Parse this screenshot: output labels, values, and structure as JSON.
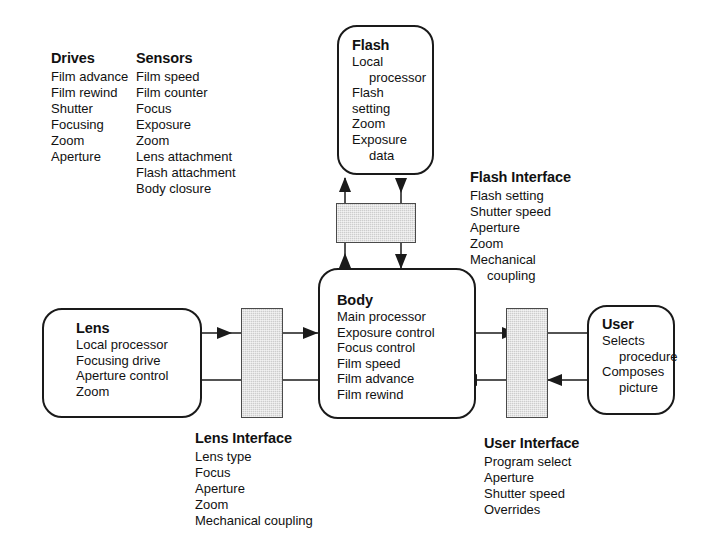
{
  "diagram": {
    "colors": {
      "stroke": "#1a1a1a",
      "interface_fill": "#cdcdcd",
      "background": "#ffffff"
    }
  },
  "annotations": {
    "drives": {
      "title": "Drives",
      "items": [
        "Film advance",
        "Film rewind",
        "Shutter",
        "Focusing",
        "Zoom",
        "Aperture"
      ]
    },
    "sensors": {
      "title": "Sensors",
      "items": [
        "Film speed",
        "Film counter",
        "Focus",
        "Exposure",
        "Zoom",
        "Lens attachment",
        "Flash attachment",
        "Body closure"
      ]
    },
    "flash_interface": {
      "title": "Flash Interface",
      "items": [
        "Flash setting",
        "Shutter speed",
        "Aperture",
        "Zoom",
        "Mechanical",
        "coupling"
      ]
    },
    "lens_interface": {
      "title": "Lens Interface",
      "items": [
        "Lens type",
        "Focus",
        "Aperture",
        "Zoom",
        "Mechanical coupling"
      ]
    },
    "user_interface": {
      "title": "User Interface",
      "items": [
        "Program select",
        "Aperture",
        "Shutter speed",
        "Overrides"
      ]
    }
  },
  "nodes": {
    "flash": {
      "title": "Flash",
      "items": [
        "Local",
        "processor",
        "Flash",
        "setting",
        "Zoom",
        "Exposure",
        "data"
      ]
    },
    "body": {
      "title": "Body",
      "items": [
        "Main processor",
        "Exposure control",
        "Focus control",
        "Film speed",
        "Film advance",
        "Film rewind"
      ]
    },
    "lens": {
      "title": "Lens",
      "items": [
        "Local processor",
        "Focusing drive",
        "Aperture control",
        "Zoom"
      ]
    },
    "user": {
      "title": "User",
      "items": [
        "Selects",
        "procedure",
        "Composes",
        "picture"
      ]
    }
  },
  "interface_bars": {
    "flash_bar": "flash-interface-bar",
    "lens_bar": "lens-interface-bar",
    "user_bar": "user-interface-bar"
  },
  "connections": [
    {
      "name": "body-to-flash",
      "direction": "up"
    },
    {
      "name": "flash-to-body",
      "direction": "down"
    },
    {
      "name": "lens-to-body",
      "direction": "right"
    },
    {
      "name": "body-to-lens",
      "direction": "left"
    },
    {
      "name": "body-to-user",
      "direction": "right"
    },
    {
      "name": "user-to-body",
      "direction": "left"
    }
  ]
}
